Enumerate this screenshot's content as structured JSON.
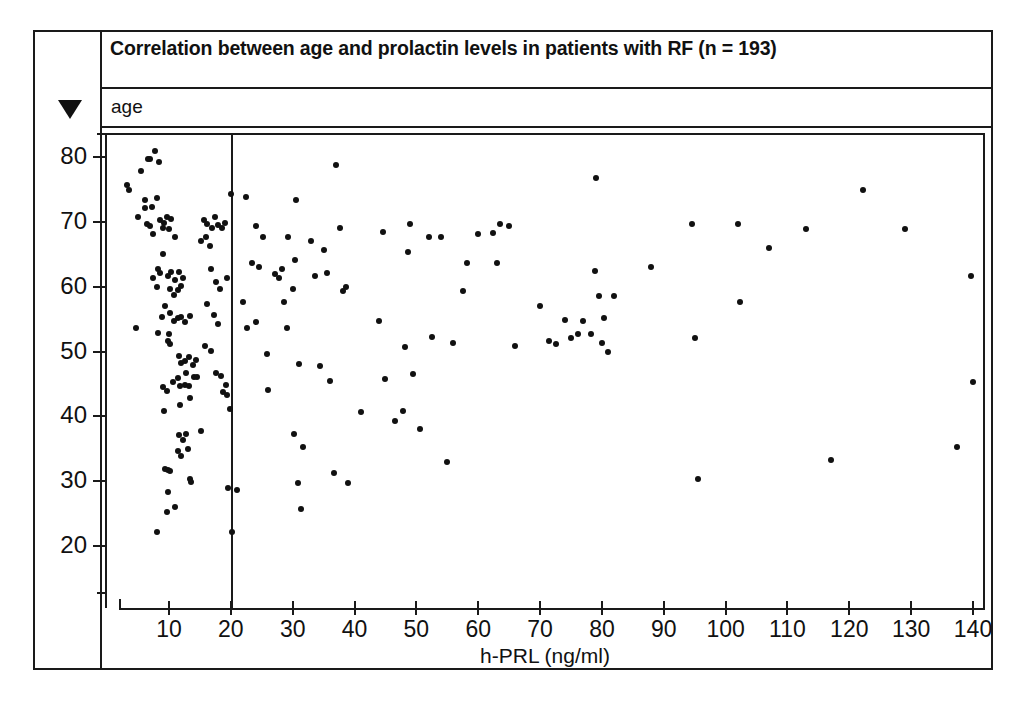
{
  "figure": {
    "title": "Correlation between age and prolactin levels in patients with RF (n = 193)",
    "y_axis_name": "age",
    "gutter_marker": "down-triangle"
  },
  "chart_data": {
    "type": "scatter",
    "title": "Correlation between age and prolactin levels in patients with RF (n = 193)",
    "xlabel": "h-PRL (ng/ml)",
    "ylabel": "age",
    "xlim": [
      0,
      145
    ],
    "ylim": [
      14,
      85
    ],
    "grid": false,
    "legend": "none",
    "n": 193,
    "xticks": [
      10,
      20,
      30,
      40,
      50,
      60,
      70,
      80,
      90,
      100,
      110,
      120,
      130,
      140
    ],
    "xtick_labels": [
      "10",
      "20",
      "30",
      "40",
      "50",
      "60",
      "70",
      "80",
      "90",
      "100",
      "110",
      "120",
      "130",
      "140"
    ],
    "yticks": [
      20,
      30,
      40,
      50,
      60,
      70,
      80
    ],
    "ytick_labels": [
      "20",
      "30",
      "40",
      "50",
      "60",
      "70",
      "80"
    ],
    "reference_lines": [
      {
        "orientation": "vertical",
        "x": 20,
        "label": ""
      }
    ],
    "marker": {
      "shape": "circle",
      "color": "#111111",
      "size": 6
    },
    "points": [
      [
        4.6,
        54.0
      ],
      [
        3.2,
        76.0
      ],
      [
        3.6,
        75.2
      ],
      [
        5.0,
        71.0
      ],
      [
        5.5,
        78.2
      ],
      [
        6.6,
        80.0
      ],
      [
        7.0,
        80.0
      ],
      [
        7.8,
        81.2
      ],
      [
        8.4,
        79.6
      ],
      [
        6.1,
        73.6
      ],
      [
        6.2,
        72.4
      ],
      [
        7.2,
        72.6
      ],
      [
        8.0,
        74.0
      ],
      [
        6.4,
        70.0
      ],
      [
        7.0,
        69.6
      ],
      [
        7.4,
        68.4
      ],
      [
        8.6,
        70.6
      ],
      [
        9.2,
        70.2
      ],
      [
        9.6,
        71.0
      ],
      [
        10.4,
        70.8
      ],
      [
        9.0,
        69.4
      ],
      [
        10.0,
        69.2
      ],
      [
        11.0,
        68.0
      ],
      [
        8.2,
        63.0
      ],
      [
        9.0,
        65.4
      ],
      [
        7.4,
        61.6
      ],
      [
        8.0,
        60.2
      ],
      [
        8.6,
        62.4
      ],
      [
        9.8,
        62.0
      ],
      [
        10.4,
        62.6
      ],
      [
        11.0,
        61.4
      ],
      [
        11.6,
        62.6
      ],
      [
        12.2,
        61.6
      ],
      [
        10.2,
        60.0
      ],
      [
        10.8,
        59.0
      ],
      [
        11.4,
        59.8
      ],
      [
        12.0,
        60.4
      ],
      [
        9.4,
        57.4
      ],
      [
        8.8,
        55.6
      ],
      [
        10.2,
        56.2
      ],
      [
        10.8,
        55.0
      ],
      [
        11.4,
        55.4
      ],
      [
        12.0,
        55.6
      ],
      [
        12.6,
        54.8
      ],
      [
        13.4,
        55.8
      ],
      [
        10.0,
        53.0
      ],
      [
        8.2,
        53.2
      ],
      [
        9.8,
        52.0
      ],
      [
        10.2,
        51.4
      ],
      [
        11.6,
        49.6
      ],
      [
        12.0,
        48.6
      ],
      [
        12.6,
        48.8
      ],
      [
        13.2,
        49.4
      ],
      [
        13.8,
        48.2
      ],
      [
        14.4,
        49.0
      ],
      [
        12.8,
        47.0
      ],
      [
        11.4,
        46.2
      ],
      [
        10.6,
        45.6
      ],
      [
        9.0,
        44.8
      ],
      [
        9.6,
        44.2
      ],
      [
        11.8,
        45.0
      ],
      [
        12.6,
        45.2
      ],
      [
        13.2,
        45.0
      ],
      [
        14.0,
        46.4
      ],
      [
        14.6,
        46.4
      ],
      [
        13.4,
        43.2
      ],
      [
        11.8,
        42.0
      ],
      [
        9.2,
        41.2
      ],
      [
        11.6,
        37.4
      ],
      [
        12.2,
        36.6
      ],
      [
        12.8,
        37.6
      ],
      [
        11.4,
        35.0
      ],
      [
        12.0,
        34.2
      ],
      [
        13.0,
        35.2
      ],
      [
        9.4,
        32.2
      ],
      [
        9.8,
        32.0
      ],
      [
        10.2,
        31.8
      ],
      [
        9.8,
        28.6
      ],
      [
        13.4,
        30.6
      ],
      [
        13.6,
        30.2
      ],
      [
        11.0,
        26.4
      ],
      [
        9.6,
        25.6
      ],
      [
        8.0,
        22.4
      ],
      [
        15.6,
        70.6
      ],
      [
        16.2,
        70.0
      ],
      [
        17.0,
        69.4
      ],
      [
        16.0,
        68.0
      ],
      [
        15.2,
        67.4
      ],
      [
        16.6,
        66.6
      ],
      [
        17.4,
        71.0
      ],
      [
        18.0,
        69.8
      ],
      [
        18.6,
        69.4
      ],
      [
        19.0,
        70.2
      ],
      [
        16.8,
        63.0
      ],
      [
        17.6,
        61.0
      ],
      [
        18.2,
        60.0
      ],
      [
        19.4,
        61.6
      ],
      [
        16.2,
        57.6
      ],
      [
        17.2,
        56.0
      ],
      [
        18.0,
        54.6
      ],
      [
        15.8,
        51.2
      ],
      [
        16.8,
        50.4
      ],
      [
        17.6,
        47.0
      ],
      [
        18.4,
        46.6
      ],
      [
        19.2,
        45.2
      ],
      [
        18.8,
        44.0
      ],
      [
        19.4,
        43.6
      ],
      [
        19.8,
        41.4
      ],
      [
        15.2,
        38.0
      ],
      [
        19.6,
        29.2
      ],
      [
        20.2,
        22.4
      ],
      [
        20.0,
        74.6
      ],
      [
        21.0,
        29.0
      ],
      [
        22.4,
        74.2
      ],
      [
        23.4,
        64.0
      ],
      [
        22.0,
        58.0
      ],
      [
        22.6,
        54.0
      ],
      [
        24.0,
        69.6
      ],
      [
        25.2,
        68.0
      ],
      [
        24.6,
        63.4
      ],
      [
        24.0,
        54.8
      ],
      [
        25.8,
        50.0
      ],
      [
        26.0,
        44.4
      ],
      [
        27.2,
        62.2
      ],
      [
        27.8,
        61.6
      ],
      [
        28.2,
        63.0
      ],
      [
        29.2,
        68.0
      ],
      [
        28.6,
        58.0
      ],
      [
        29.0,
        54.0
      ],
      [
        30.6,
        73.6
      ],
      [
        30.0,
        60.0
      ],
      [
        30.4,
        64.4
      ],
      [
        31.0,
        48.4
      ],
      [
        30.2,
        37.6
      ],
      [
        31.6,
        35.6
      ],
      [
        30.8,
        30.0
      ],
      [
        31.4,
        26.0
      ],
      [
        33.0,
        67.4
      ],
      [
        33.6,
        62.0
      ],
      [
        35.0,
        66.0
      ],
      [
        35.6,
        62.4
      ],
      [
        34.4,
        48.0
      ],
      [
        36.0,
        45.8
      ],
      [
        36.6,
        31.6
      ],
      [
        37.0,
        79.0
      ],
      [
        37.6,
        69.4
      ],
      [
        38.2,
        59.6
      ],
      [
        38.6,
        60.2
      ],
      [
        39.0,
        30.0
      ],
      [
        41.0,
        41.0
      ],
      [
        44.0,
        55.0
      ],
      [
        44.6,
        68.8
      ],
      [
        45.0,
        46.0
      ],
      [
        46.6,
        39.6
      ],
      [
        47.8,
        41.2
      ],
      [
        49.0,
        70.0
      ],
      [
        48.6,
        65.6
      ],
      [
        48.2,
        51.0
      ],
      [
        49.4,
        46.8
      ],
      [
        50.6,
        38.4
      ],
      [
        52.0,
        68.0
      ],
      [
        52.6,
        52.6
      ],
      [
        54.0,
        68.0
      ],
      [
        55.0,
        33.2
      ],
      [
        56.0,
        51.6
      ],
      [
        57.6,
        59.6
      ],
      [
        58.2,
        64.0
      ],
      [
        60.0,
        68.4
      ],
      [
        62.4,
        68.6
      ],
      [
        63.0,
        64.0
      ],
      [
        63.6,
        70.0
      ],
      [
        65.0,
        69.6
      ],
      [
        66.0,
        51.2
      ],
      [
        70.0,
        57.4
      ],
      [
        71.4,
        52.0
      ],
      [
        72.6,
        51.4
      ],
      [
        74.0,
        55.2
      ],
      [
        75.0,
        52.4
      ],
      [
        76.2,
        53.0
      ],
      [
        77.0,
        55.0
      ],
      [
        78.2,
        53.0
      ],
      [
        79.0,
        77.0
      ],
      [
        78.8,
        62.8
      ],
      [
        79.6,
        58.8
      ],
      [
        80.4,
        55.4
      ],
      [
        80.0,
        51.6
      ],
      [
        81.0,
        50.2
      ],
      [
        82.0,
        58.8
      ],
      [
        88.0,
        63.4
      ],
      [
        94.6,
        70.0
      ],
      [
        95.0,
        52.4
      ],
      [
        95.6,
        30.6
      ],
      [
        102.0,
        70.0
      ],
      [
        102.4,
        58.0
      ],
      [
        107.0,
        66.2
      ],
      [
        113.0,
        69.2
      ],
      [
        117.0,
        33.6
      ],
      [
        122.2,
        75.2
      ],
      [
        129.0,
        69.2
      ],
      [
        137.4,
        35.6
      ],
      [
        139.6,
        62.0
      ],
      [
        140.0,
        45.6
      ]
    ]
  }
}
